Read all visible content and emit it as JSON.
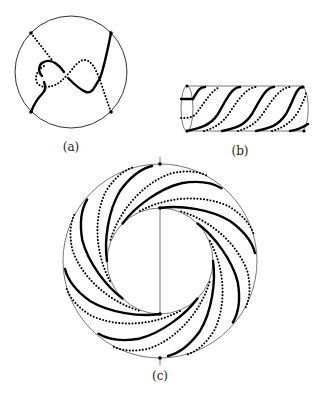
{
  "figure": {
    "panels": [
      {
        "id": "a",
        "caption": "(a)",
        "description": "disk with two crossing strands, one solid and one dotted, with four boundary marked points"
      },
      {
        "id": "b",
        "caption": "(b)",
        "description": "cylinder with alternating solid and dotted helical strands"
      },
      {
        "id": "c",
        "caption": "(c)",
        "description": "annulus with alternating solid and dotted spiral arcs, a radial segment and marked points"
      }
    ],
    "colors": {
      "stroke": "#000000",
      "boundary": "#333333",
      "background": "#ffffff"
    }
  }
}
